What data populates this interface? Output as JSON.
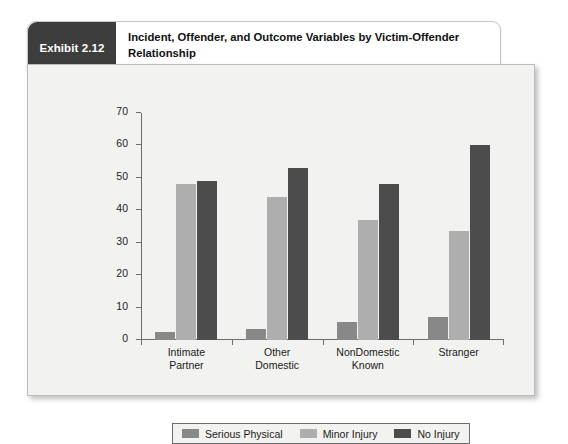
{
  "exhibit": {
    "tag": "Exhibit 2.12",
    "title": "Incident, Offender, and Outcome Variables by Victim-Offender Relationship"
  },
  "chart_data": {
    "type": "bar",
    "title": "Incident, Offender, and Outcome Variables by Victim-Offender Relationship",
    "xlabel": "",
    "ylabel": "",
    "ylim": [
      0,
      70
    ],
    "yticks": [
      0,
      10,
      20,
      30,
      40,
      50,
      60,
      70
    ],
    "grid": false,
    "legend_position": "bottom",
    "categories": [
      "Intimate Partner",
      "Other Domestic",
      "NonDomestic Known",
      "Stranger"
    ],
    "category_lines": [
      [
        "Intimate",
        "Partner"
      ],
      [
        "Other",
        "Domestic"
      ],
      [
        "NonDomestic",
        "Known"
      ],
      [
        "Stranger"
      ]
    ],
    "series": [
      {
        "name": "Serious Physical",
        "color": "#888888",
        "values": [
          2.5,
          3.5,
          5.5,
          7
        ]
      },
      {
        "name": "Minor Injury",
        "color": "#aeaeae",
        "values": [
          48,
          44,
          37,
          33.5
        ]
      },
      {
        "name": "No Injury",
        "color": "#4c4c4c",
        "values": [
          49,
          53,
          48,
          60
        ]
      }
    ]
  },
  "colors": {
    "serious_physical": "#888888",
    "minor_injury": "#aeaeae",
    "no_injury": "#4c4c4c",
    "panel_background": "#f2f2f0",
    "tag_background": "#3d3d3d",
    "axis": "#6e6e6e"
  }
}
